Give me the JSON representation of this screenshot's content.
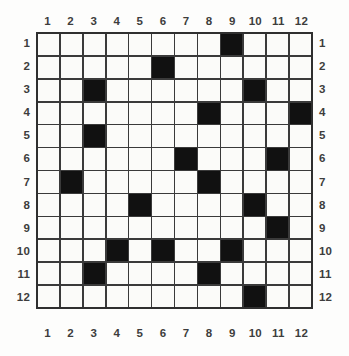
{
  "puzzle": {
    "type": "grid-fill-puzzle",
    "rows": 12,
    "columns": 12,
    "colors": {
      "filled_cell": "#111111",
      "empty_cell": "#fbfbf9",
      "grid_line": "#3a3a3a",
      "border": "#2f2f2f",
      "label_text": "#3d3d3d",
      "background": "#fdfdfc"
    },
    "column_labels": [
      "1",
      "2",
      "3",
      "4",
      "5",
      "6",
      "7",
      "8",
      "9",
      "10",
      "11",
      "12"
    ],
    "row_labels": [
      "1",
      "2",
      "3",
      "4",
      "5",
      "6",
      "7",
      "8",
      "9",
      "10",
      "11",
      "12"
    ],
    "filled_cells_by_row": [
      [
        9
      ],
      [
        6
      ],
      [
        3,
        10
      ],
      [
        8,
        12
      ],
      [
        3
      ],
      [
        7,
        11
      ],
      [
        2,
        8
      ],
      [
        5,
        10
      ],
      [
        11
      ],
      [
        4,
        6,
        9
      ],
      [
        3,
        8
      ],
      [
        10
      ]
    ],
    "grid": [
      [
        0,
        0,
        0,
        0,
        0,
        0,
        0,
        0,
        1,
        0,
        0,
        0
      ],
      [
        0,
        0,
        0,
        0,
        0,
        1,
        0,
        0,
        0,
        0,
        0,
        0
      ],
      [
        0,
        0,
        1,
        0,
        0,
        0,
        0,
        0,
        0,
        1,
        0,
        0
      ],
      [
        0,
        0,
        0,
        0,
        0,
        0,
        0,
        1,
        0,
        0,
        0,
        1
      ],
      [
        0,
        0,
        1,
        0,
        0,
        0,
        0,
        0,
        0,
        0,
        0,
        0
      ],
      [
        0,
        0,
        0,
        0,
        0,
        0,
        1,
        0,
        0,
        0,
        1,
        0
      ],
      [
        0,
        1,
        0,
        0,
        0,
        0,
        0,
        1,
        0,
        0,
        0,
        0
      ],
      [
        0,
        0,
        0,
        0,
        1,
        0,
        0,
        0,
        0,
        1,
        0,
        0
      ],
      [
        0,
        0,
        0,
        0,
        0,
        0,
        0,
        0,
        0,
        0,
        1,
        0
      ],
      [
        0,
        0,
        0,
        1,
        0,
        1,
        0,
        0,
        1,
        0,
        0,
        0
      ],
      [
        0,
        0,
        1,
        0,
        0,
        0,
        0,
        1,
        0,
        0,
        0,
        0
      ],
      [
        0,
        0,
        0,
        0,
        0,
        0,
        0,
        0,
        0,
        1,
        0,
        0
      ]
    ],
    "filled_count": 19
  }
}
